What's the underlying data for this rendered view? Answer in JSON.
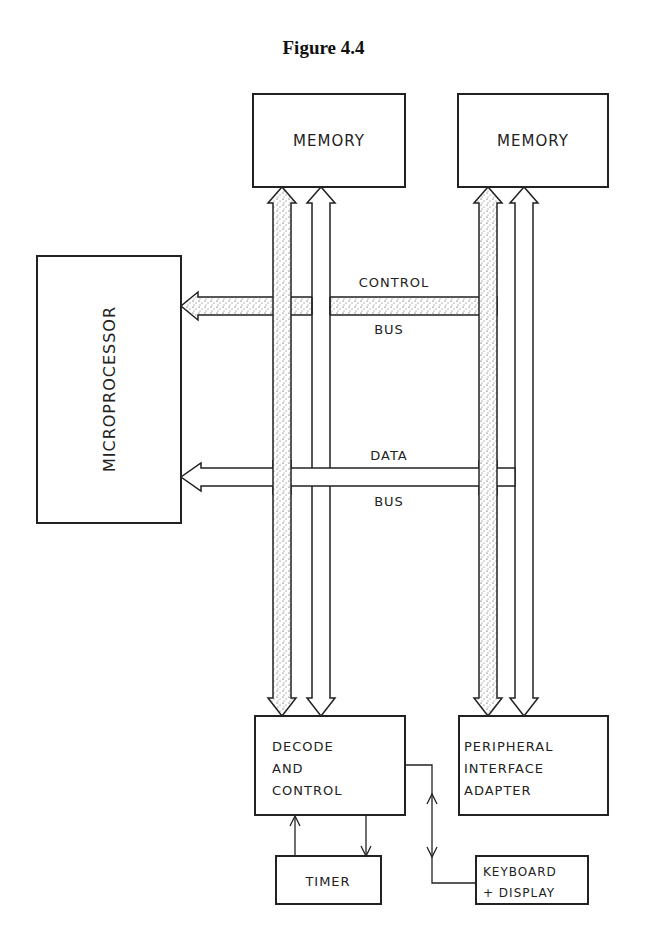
{
  "figure": {
    "title": "Figure 4.4"
  },
  "blocks": {
    "memory_left": "MEMORY",
    "memory_right": "MEMORY",
    "microprocessor": "MICROPROCESSOR",
    "decode_line1": "DECODE",
    "decode_line2": "AND",
    "decode_line3": "CONTROL",
    "pia_line1": "PERIPHERAL",
    "pia_line2": "INTERFACE",
    "pia_line3": "ADAPTER",
    "timer": "TIMER",
    "keyboard_line1": "KEYBOARD",
    "keyboard_line2": "+ DISPLAY"
  },
  "buses": {
    "control_top": "CONTROL",
    "control_bottom": "BUS",
    "data_top": "DATA",
    "data_bottom": "BUS"
  },
  "colors": {
    "line": "#222222",
    "background": "#ffffff"
  }
}
